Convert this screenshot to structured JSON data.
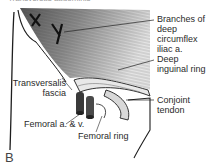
{
  "figure": {
    "top_caption": "Transversus abdominis",
    "panel_letter": "B",
    "labels": {
      "branches": [
        "Branches of",
        "deep",
        "circumflex",
        "iliac a."
      ],
      "deep_ring": [
        "Deep",
        "inguinal ring"
      ],
      "transversalis": [
        "Transversalis",
        "fascia"
      ],
      "conjoint": [
        "Conjoint",
        "tendon"
      ],
      "femoral_av": "Femoral a. & v.",
      "femoral_ring": "Femoral ring"
    },
    "colors": {
      "muscle_dark": "#4a4a4a",
      "muscle_mid": "#8a8a8a",
      "muscle_light": "#cfcfcf",
      "outline": "#1e1e1e",
      "vessel": "#3a3a3a"
    }
  }
}
